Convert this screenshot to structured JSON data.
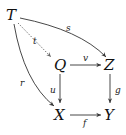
{
  "diagram": {
    "type": "commutative-diagram",
    "nodes": {
      "T": "T",
      "Q": "Q",
      "Z": "Z",
      "X": "X",
      "Y": "Y"
    },
    "arrows": {
      "s": {
        "label": "s",
        "from": "T",
        "to": "Z",
        "style": "solid-curved"
      },
      "t": {
        "label": "t",
        "from": "T",
        "to": "Q",
        "style": "dashed"
      },
      "r": {
        "label": "r",
        "from": "T",
        "to": "X",
        "style": "solid-curved"
      },
      "v": {
        "label": "v",
        "from": "Q",
        "to": "Z",
        "style": "solid"
      },
      "u": {
        "label": "u",
        "from": "Q",
        "to": "X",
        "style": "solid"
      },
      "g": {
        "label": "g",
        "from": "Z",
        "to": "Y",
        "style": "solid"
      },
      "f": {
        "label": "f",
        "from": "X",
        "to": "Y",
        "style": "solid"
      }
    }
  }
}
